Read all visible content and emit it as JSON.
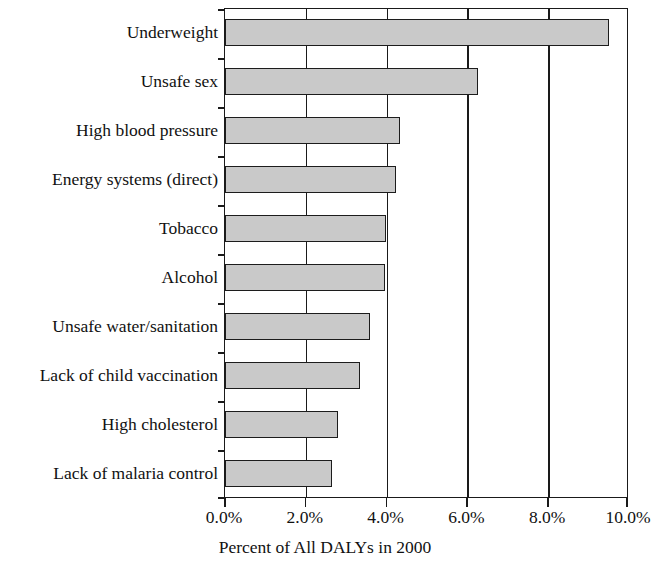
{
  "chart_data": {
    "type": "bar",
    "orientation": "horizontal",
    "title": "",
    "xlabel": "Percent of All DALYs in 2000",
    "ylabel": "",
    "categories": [
      "Underweight",
      "Unsafe sex",
      "High blood pressure",
      "Energy systems (direct)",
      "Tobacco",
      "Alcohol",
      "Unsafe water/sanitation",
      "Lack of child vaccination",
      "High cholesterol",
      "Lack of malaria control"
    ],
    "values": [
      9.55,
      6.3,
      4.35,
      4.25,
      4.0,
      3.98,
      3.6,
      3.35,
      2.8,
      2.65
    ],
    "xlim": [
      0,
      10
    ],
    "xticks": [
      0,
      2,
      4,
      6,
      8,
      10
    ],
    "xtick_labels": [
      "0.0%",
      "2.0%",
      "4.0%",
      "6.0%",
      "8.0%",
      "10.0%"
    ],
    "grid": true,
    "grid_axis": "x",
    "legend": null,
    "bar_fill_color": "#c9c9c9",
    "bar_edge_color": "#1c1c1c",
    "axis_color": "#1a1a1a",
    "background_color": "#ffffff"
  }
}
